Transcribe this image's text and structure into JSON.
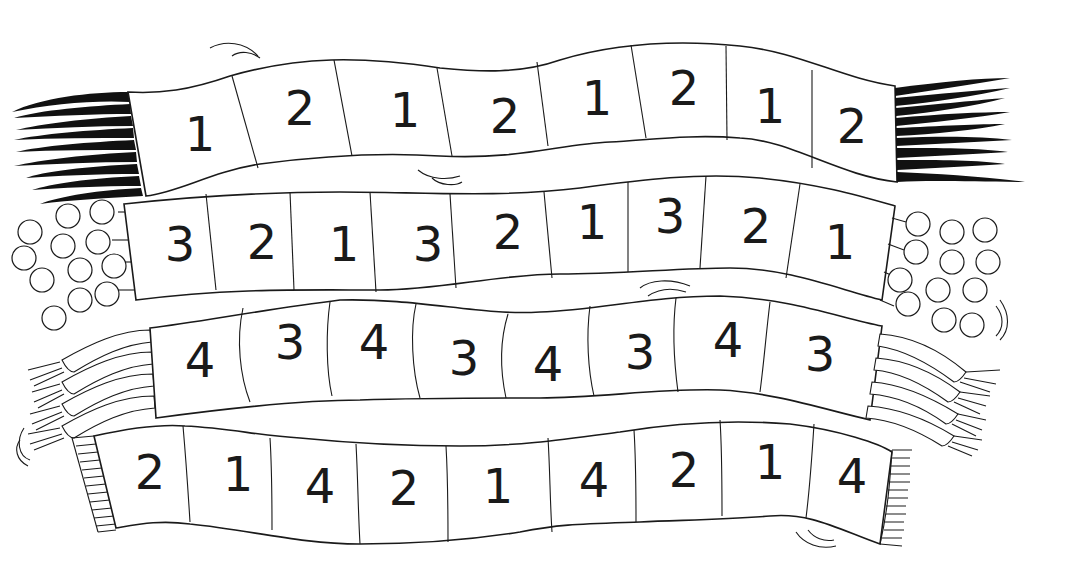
{
  "scarves": [
    {
      "name": "scarf-1",
      "fringe": "black-strands",
      "cells": [
        "1",
        "2",
        "1",
        "2",
        "1",
        "2",
        "1",
        "2"
      ]
    },
    {
      "name": "scarf-2",
      "fringe": "pompoms",
      "cells": [
        "3",
        "2",
        "1",
        "3",
        "2",
        "1",
        "3",
        "2",
        "1"
      ]
    },
    {
      "name": "scarf-3",
      "fringe": "braided-tassels",
      "cells": [
        "4",
        "3",
        "4",
        "3",
        "4",
        "3",
        "4",
        "3"
      ]
    },
    {
      "name": "scarf-4",
      "fringe": "short-fringe",
      "cells": [
        "2",
        "1",
        "4",
        "2",
        "1",
        "4",
        "2",
        "1",
        "4"
      ]
    }
  ]
}
